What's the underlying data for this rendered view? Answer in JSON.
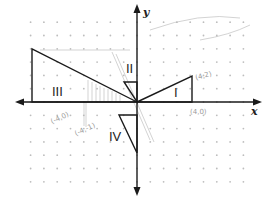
{
  "diagram": {
    "axes": {
      "x_label": "x",
      "y_label": "y",
      "origin_px": [
        137,
        102
      ],
      "unit_px": 13.3
    },
    "triangles": [
      {
        "label": "I",
        "points": "137,102 192,102 192,76",
        "label_pos": [
          177,
          96
        ]
      },
      {
        "label": "II",
        "points": "137,102 137,82 124,82",
        "label_pos": [
          131,
          73
        ]
      },
      {
        "label": "III",
        "points": "137,102 32,102 32,49",
        "label_pos": [
          62,
          94
        ]
      },
      {
        "label": "IV",
        "points": "137,115 119,115 137,153",
        "label_pos": [
          116,
          137
        ]
      }
    ],
    "annotations": [
      {
        "text": "(4,0)",
        "x": 190,
        "y": 114
      },
      {
        "text": "(4,2)",
        "x": 196,
        "y": 78
      },
      {
        "text": "(-4,0)",
        "x": 54,
        "y": 121
      },
      {
        "text": "(-4,-1)",
        "x": 78,
        "y": 131
      }
    ],
    "colors": {
      "line": "#1a1a1a",
      "dot": "#bdbdbd",
      "pencil": "#a8a8a8"
    }
  }
}
